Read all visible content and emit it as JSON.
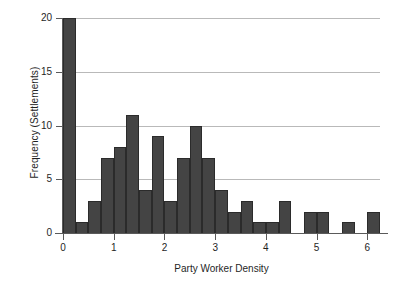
{
  "chart_data": {
    "type": "bar",
    "title": "",
    "subtitle": "",
    "xlabel": "Party Worker Density",
    "ylabel": "Frequency (Settlements)",
    "xlim": [
      0,
      6.25
    ],
    "ylim": [
      0,
      20
    ],
    "grid": "horizontal",
    "legend": "none",
    "bar_color": "#444444",
    "bin_width": 0.25,
    "x_ticks": [
      0,
      1,
      2,
      3,
      4,
      5,
      6
    ],
    "x_tick_labels": [
      "0",
      "1",
      "2",
      "3",
      "4",
      "5",
      "6"
    ],
    "y_ticks": [
      0,
      5,
      10,
      15,
      20
    ],
    "y_tick_labels": [
      "0",
      "5",
      "10",
      "15",
      "20"
    ],
    "bins": [
      {
        "x0": 0.0,
        "x1": 0.25,
        "value": 20
      },
      {
        "x0": 0.25,
        "x1": 0.5,
        "value": 1
      },
      {
        "x0": 0.5,
        "x1": 0.75,
        "value": 3
      },
      {
        "x0": 0.75,
        "x1": 1.0,
        "value": 7
      },
      {
        "x0": 1.0,
        "x1": 1.25,
        "value": 8
      },
      {
        "x0": 1.25,
        "x1": 1.5,
        "value": 11
      },
      {
        "x0": 1.5,
        "x1": 1.75,
        "value": 4
      },
      {
        "x0": 1.75,
        "x1": 2.0,
        "value": 9
      },
      {
        "x0": 2.0,
        "x1": 2.25,
        "value": 3
      },
      {
        "x0": 2.25,
        "x1": 2.5,
        "value": 7
      },
      {
        "x0": 2.5,
        "x1": 2.75,
        "value": 10
      },
      {
        "x0": 2.75,
        "x1": 3.0,
        "value": 7
      },
      {
        "x0": 3.0,
        "x1": 3.25,
        "value": 4
      },
      {
        "x0": 3.25,
        "x1": 3.5,
        "value": 2
      },
      {
        "x0": 3.5,
        "x1": 3.75,
        "value": 3
      },
      {
        "x0": 3.75,
        "x1": 4.0,
        "value": 1
      },
      {
        "x0": 4.0,
        "x1": 4.25,
        "value": 1
      },
      {
        "x0": 4.25,
        "x1": 4.5,
        "value": 3
      },
      {
        "x0": 4.5,
        "x1": 4.75,
        "value": 0
      },
      {
        "x0": 4.75,
        "x1": 5.0,
        "value": 2
      },
      {
        "x0": 5.0,
        "x1": 5.25,
        "value": 2
      },
      {
        "x0": 5.25,
        "x1": 5.5,
        "value": 0
      },
      {
        "x0": 5.5,
        "x1": 5.75,
        "value": 1
      },
      {
        "x0": 5.75,
        "x1": 6.0,
        "value": 0
      },
      {
        "x0": 6.0,
        "x1": 6.25,
        "value": 2
      }
    ],
    "categories": [
      "0-0.25",
      "0.25-0.5",
      "0.5-0.75",
      "0.75-1",
      "1-1.25",
      "1.25-1.5",
      "1.5-1.75",
      "1.75-2",
      "2-2.25",
      "2.25-2.5",
      "2.5-2.75",
      "2.75-3",
      "3-3.25",
      "3.25-3.5",
      "3.5-3.75",
      "3.75-4",
      "4-4.25",
      "4.25-4.5",
      "4.5-4.75",
      "4.75-5",
      "5-5.25",
      "5.25-5.5",
      "5.5-5.75",
      "5.75-6",
      "6-6.25"
    ],
    "values": [
      20,
      1,
      3,
      7,
      8,
      11,
      4,
      9,
      3,
      7,
      10,
      7,
      4,
      2,
      3,
      1,
      1,
      3,
      0,
      2,
      2,
      0,
      1,
      0,
      2
    ]
  }
}
